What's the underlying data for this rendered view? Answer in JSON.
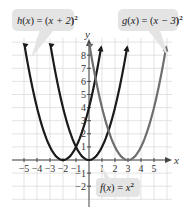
{
  "chart_data": {
    "type": "line",
    "title": "",
    "xlabel": "x",
    "ylabel": "y",
    "xlim": [
      -5.8,
      6.3
    ],
    "ylim": [
      -2.8,
      8.6
    ],
    "grid": true,
    "x_ticks": [
      -5,
      -4,
      -3,
      -2,
      -1,
      1,
      2,
      3,
      4,
      5
    ],
    "x_tick_labels": [
      "-5",
      "-4",
      "-3",
      "-2",
      "-1",
      "1",
      "2",
      "3",
      "4",
      "5"
    ],
    "y_ticks": [
      -2,
      -1,
      1,
      2,
      3,
      4,
      5,
      6,
      7,
      8
    ],
    "y_tick_labels": [
      "-2",
      "-1",
      "1",
      "2",
      "3",
      "4",
      "5",
      "6",
      "7",
      "8"
    ],
    "series": [
      {
        "name": "h(x) = (x + 2)²",
        "function": "(x+2)^2",
        "vertex": [
          -2,
          0
        ],
        "color": "#1a1a1a",
        "x": [
          -5,
          -4,
          -3,
          -2,
          -1,
          0,
          1
        ],
        "y": [
          9,
          4,
          1,
          0,
          1,
          4,
          9
        ]
      },
      {
        "name": "f(x) = x²",
        "function": "x^2",
        "vertex": [
          0,
          0
        ],
        "color": "#1a1a1a",
        "x": [
          -3,
          -2,
          -1,
          0,
          1,
          2,
          3
        ],
        "y": [
          9,
          4,
          1,
          0,
          1,
          4,
          9
        ]
      },
      {
        "name": "g(x) = (x − 3)²",
        "function": "(x-3)^2",
        "vertex": [
          3,
          0
        ],
        "color": "#6e6e6e",
        "x": [
          0,
          1,
          2,
          3,
          4,
          5,
          6
        ],
        "y": [
          9,
          4,
          1,
          0,
          1,
          4,
          9
        ]
      }
    ],
    "annotations": [
      {
        "text": "h(x) = (x + 2)²",
        "position": "top-left callout"
      },
      {
        "text": "g(x) = (x − 3)²",
        "position": "top-right callout"
      },
      {
        "text": "f(x) = x²",
        "position": "bottom callout"
      }
    ],
    "legend": "callouts"
  },
  "labels": {
    "x_axis": "x",
    "y_axis": "y",
    "callout_h": {
      "func": "h",
      "arg": "x",
      "eq": " = ",
      "body": "x + 2",
      "exp": "2"
    },
    "callout_g": {
      "func": "g",
      "arg": "x",
      "eq": " = ",
      "body": "x − 3",
      "exp": "2"
    },
    "callout_f": {
      "func": "f",
      "arg": "x",
      "eq": " = ",
      "body": "x",
      "exp": "2"
    }
  },
  "colors": {
    "grid": "#dcdcdc",
    "axis": "#444444",
    "curve_dark": "#1a1a1a",
    "curve_gray": "#6e6e6e",
    "callout_bg": "#e4e4e4"
  }
}
